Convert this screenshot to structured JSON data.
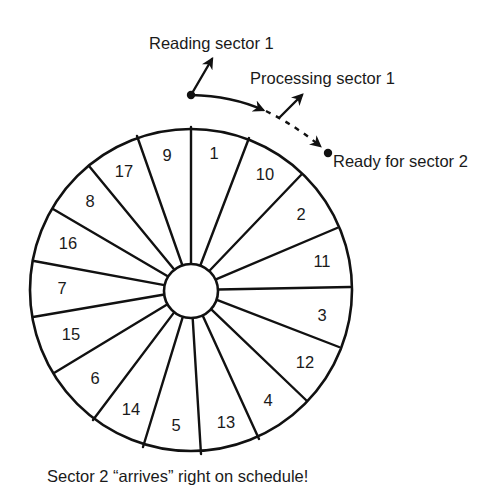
{
  "diagram": {
    "labels": {
      "reading": "Reading sector 1",
      "processing": "Processing sector 1",
      "ready": "Ready for sector 2",
      "caption": "Sector 2 “arrives” right on schedule!"
    },
    "disk": {
      "center": [
        191,
        290
      ],
      "outer_radius": 161,
      "hub_radius": 27,
      "sector_count": 17,
      "spoke_outer_points": [
        [
          191,
          127
        ],
        [
          249,
          138
        ],
        [
          301,
          175
        ],
        [
          337,
          228
        ],
        [
          350,
          287
        ],
        [
          339,
          347
        ],
        [
          307,
          401
        ],
        [
          259,
          439
        ],
        [
          201,
          454
        ],
        [
          143,
          447
        ],
        [
          93,
          420
        ],
        [
          54,
          373
        ],
        [
          33,
          317
        ],
        [
          34,
          261
        ],
        [
          53,
          209
        ],
        [
          89,
          166
        ],
        [
          137,
          136
        ]
      ],
      "sectors": [
        {
          "label": "1",
          "pos": [
            214,
            153
          ]
        },
        {
          "label": "10",
          "pos": [
            265,
            174
          ]
        },
        {
          "label": "2",
          "pos": [
            301,
            214
          ]
        },
        {
          "label": "11",
          "pos": [
            322,
            261
          ]
        },
        {
          "label": "3",
          "pos": [
            322,
            315
          ]
        },
        {
          "label": "12",
          "pos": [
            305,
            362
          ]
        },
        {
          "label": "4",
          "pos": [
            268,
            400
          ]
        },
        {
          "label": "13",
          "pos": [
            226,
            422
          ]
        },
        {
          "label": "5",
          "pos": [
            176,
            425
          ]
        },
        {
          "label": "14",
          "pos": [
            131,
            409
          ]
        },
        {
          "label": "6",
          "pos": [
            95,
            378
          ]
        },
        {
          "label": "15",
          "pos": [
            71,
            334
          ]
        },
        {
          "label": "7",
          "pos": [
            62,
            288
          ]
        },
        {
          "label": "16",
          "pos": [
            68,
            243
          ]
        },
        {
          "label": "8",
          "pos": [
            90,
            201
          ]
        },
        {
          "label": "17",
          "pos": [
            124,
            171
          ]
        },
        {
          "label": "9",
          "pos": [
            167,
            155
          ]
        }
      ]
    },
    "colors": {
      "ink": "#111111",
      "background": "#ffffff"
    }
  }
}
